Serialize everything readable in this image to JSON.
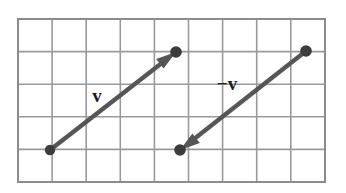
{
  "figure": {
    "background_color": "#ffffff",
    "grid": {
      "line_color": "#9a9a9a",
      "border_color": "#8c8c8c",
      "x_start": 18,
      "y_start": 19,
      "x_end": 325,
      "y_end": 182,
      "columns": 9,
      "rows": 5,
      "cell_width": 34.1,
      "cell_height": 32.6
    },
    "vector_color": "#565656",
    "dot_color": "#3c3c3c",
    "vectors": [
      {
        "name": "v",
        "label": "v",
        "label_x": 97,
        "label_y": 102,
        "tail_x": 50,
        "tail_y": 150,
        "head_x": 176,
        "head_y": 52,
        "dx": 126,
        "dy": -98,
        "arrow_at": "head",
        "dots": [
          "tail",
          "head"
        ]
      },
      {
        "name": "-v",
        "label": "−v",
        "label_x": 227,
        "label_y": 90,
        "tail_x": 306,
        "tail_y": 51,
        "head_x": 180,
        "head_y": 150,
        "dx": -126,
        "dy": 99,
        "arrow_at": "head",
        "dots": [
          "tail",
          "head"
        ]
      }
    ]
  }
}
